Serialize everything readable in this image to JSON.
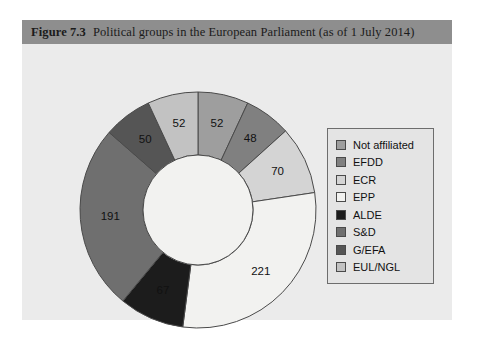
{
  "figure": {
    "number": "Figure 7.3",
    "title": "Political groups in the European Parliament (as of 1 July 2014)",
    "background": "#ebebeb",
    "title_bar_color": "#8e8e8e"
  },
  "legend": {
    "items": [
      {
        "label": "Not affiliated",
        "color": "#9e9e9e"
      },
      {
        "label": "EFDD",
        "color": "#808080"
      },
      {
        "label": "ECR",
        "color": "#d4d4d4"
      },
      {
        "label": "EPP",
        "color": "#f2f2f0"
      },
      {
        "label": "ALDE",
        "color": "#1c1c1c"
      },
      {
        "label": "S&D",
        "color": "#6f6f6f"
      },
      {
        "label": "G/EFA",
        "color": "#555555"
      },
      {
        "label": "EUL/NGL",
        "color": "#c2c2c2"
      }
    ]
  },
  "chart_data": {
    "type": "pie",
    "title": "Political groups in the European Parliament (as of 1 July 2014)",
    "subtype": "donut",
    "total": 751,
    "start_angle_deg": 0,
    "direction": "clockwise",
    "legend_position": "right",
    "categories": [
      "Not affiliated",
      "EFDD",
      "ECR",
      "EPP",
      "ALDE",
      "S&D",
      "G/EFA",
      "EUL/NGL"
    ],
    "values": [
      52,
      48,
      70,
      221,
      67,
      191,
      50,
      52
    ],
    "colors": [
      "#9e9e9e",
      "#808080",
      "#d4d4d4",
      "#f2f2f0",
      "#1c1c1c",
      "#6f6f6f",
      "#555555",
      "#c2c2c2"
    ],
    "slices": [
      {
        "name": "Not affiliated",
        "value": 52,
        "color": "#9e9e9e",
        "label": "52"
      },
      {
        "name": "EFDD",
        "value": 48,
        "color": "#808080",
        "label": "48"
      },
      {
        "name": "ECR",
        "value": 70,
        "color": "#d4d4d4",
        "label": "70"
      },
      {
        "name": "EPP",
        "value": 221,
        "color": "#f2f2f0",
        "label": "221"
      },
      {
        "name": "ALDE",
        "value": 67,
        "color": "#1c1c1c",
        "label": "67"
      },
      {
        "name": "S&D",
        "value": 191,
        "color": "#6f6f6f",
        "label": "191"
      },
      {
        "name": "G/EFA",
        "value": 50,
        "color": "#555555",
        "label": "50"
      },
      {
        "name": "EUL/NGL",
        "value": 52,
        "color": "#c2c2c2",
        "label": "52"
      }
    ],
    "xlabel": "",
    "ylabel": ""
  },
  "geometry": {
    "cx": 164,
    "cy": 154,
    "outer_r": 118,
    "inner_r": 55,
    "label_r": 88,
    "stroke": "#4a4a4a",
    "hole_fill": "#f2f2f0"
  }
}
